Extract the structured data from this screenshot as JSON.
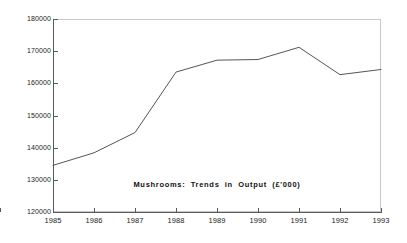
{
  "chart_data": {
    "type": "line",
    "title": "Mushrooms:  Trends  in  Output  (£'000)",
    "xlabel": "",
    "ylabel": "",
    "categories": [
      "1985",
      "1986",
      "1987",
      "1988",
      "1989",
      "1990",
      "1991",
      "1992",
      "1993"
    ],
    "values": [
      134500,
      138400,
      144700,
      163500,
      167200,
      167400,
      171200,
      162700,
      164300
    ],
    "series": [
      {
        "name": "Mushrooms output",
        "values": [
          134500,
          138400,
          144700,
          163500,
          167200,
          167400,
          171200,
          162700,
          164300
        ]
      }
    ],
    "xlim": [
      1985,
      1993
    ],
    "ylim": [
      120000,
      180000
    ],
    "ytick_labels": [
      "180000",
      "170000",
      "160000",
      "150000",
      "140000",
      "130000",
      "120000"
    ],
    "ytick_values": [
      180000,
      170000,
      160000,
      150000,
      140000,
      130000,
      120000
    ],
    "xtick_labels": [
      "1985",
      "1986",
      "1987",
      "1988",
      "1989",
      "1990",
      "1991",
      "1992",
      "1993"
    ],
    "grid": false,
    "legend": "none",
    "line_color": "#555555",
    "frame_color": "#c8c8c8",
    "axis_color": "#5a5a5a",
    "background": "#ffffff"
  }
}
